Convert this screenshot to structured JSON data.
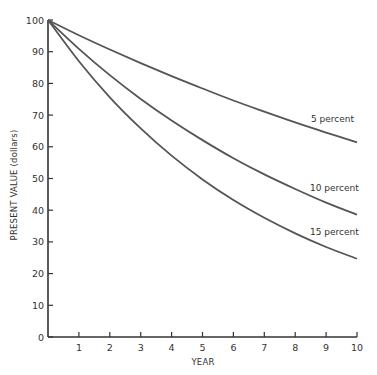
{
  "chart_data": {
    "type": "line",
    "title": "",
    "xlabel": "YEAR",
    "ylabel": "PRESENT VALUE (dollars)",
    "x": [
      0,
      1,
      2,
      3,
      4,
      5,
      6,
      7,
      8,
      9,
      10
    ],
    "x_ticks": [
      "1",
      "2",
      "3",
      "4",
      "5",
      "6",
      "7",
      "8",
      "9",
      "10"
    ],
    "y_ticks": [
      "0",
      "10",
      "20",
      "30",
      "40",
      "50",
      "60",
      "70",
      "80",
      "90",
      "100"
    ],
    "xlim": [
      0,
      10
    ],
    "ylim": [
      0,
      100
    ],
    "grid": false,
    "legend": "inline labels at right end of curves",
    "series": [
      {
        "name": "5 percent",
        "values": [
          100,
          95.2,
          90.7,
          86.4,
          82.3,
          78.4,
          74.6,
          71.1,
          67.7,
          64.5,
          61.4
        ]
      },
      {
        "name": "10 percent",
        "values": [
          100,
          90.9,
          82.6,
          75.1,
          68.3,
          62.1,
          56.4,
          51.3,
          46.7,
          42.4,
          38.6
        ]
      },
      {
        "name": "15 percent",
        "values": [
          100,
          87.0,
          75.6,
          65.8,
          57.2,
          49.7,
          43.2,
          37.6,
          32.7,
          28.4,
          24.7
        ]
      }
    ],
    "line_color": "#555555",
    "axis_color": "#333333"
  }
}
